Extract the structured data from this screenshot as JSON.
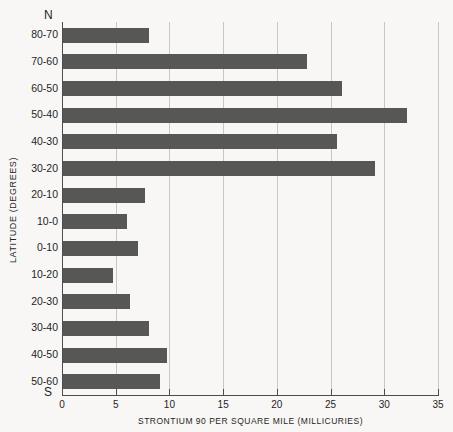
{
  "top_caption": "",
  "poles": {
    "north": "N",
    "south": "S"
  },
  "chart_data": {
    "type": "bar",
    "orientation": "horizontal",
    "title": "",
    "xlabel": "STRONTIUM 90 PER SQUARE MILE (MILLICURIES)",
    "ylabel": "LATITUDE (DEGREES)",
    "xlim": [
      0,
      35
    ],
    "ylim": null,
    "grid": true,
    "legend": null,
    "bar_color": "#575756",
    "xticks": [
      0,
      5,
      10,
      15,
      20,
      25,
      30,
      35
    ],
    "xtick_labels": [
      "0",
      "5",
      "10",
      "15",
      "20",
      "25",
      "30",
      "35"
    ],
    "categories": [
      "80-70",
      "70-60",
      "60-50",
      "50-40",
      "40-30",
      "30-20",
      "20-10",
      "10-0",
      "0-10",
      "10-20",
      "20-30",
      "30-40",
      "40-50",
      "50-60"
    ],
    "values": [
      8.0,
      22.7,
      26.0,
      32.0,
      25.5,
      29.0,
      7.6,
      6.0,
      7.0,
      4.7,
      6.2,
      8.0,
      9.7,
      9.0
    ]
  }
}
